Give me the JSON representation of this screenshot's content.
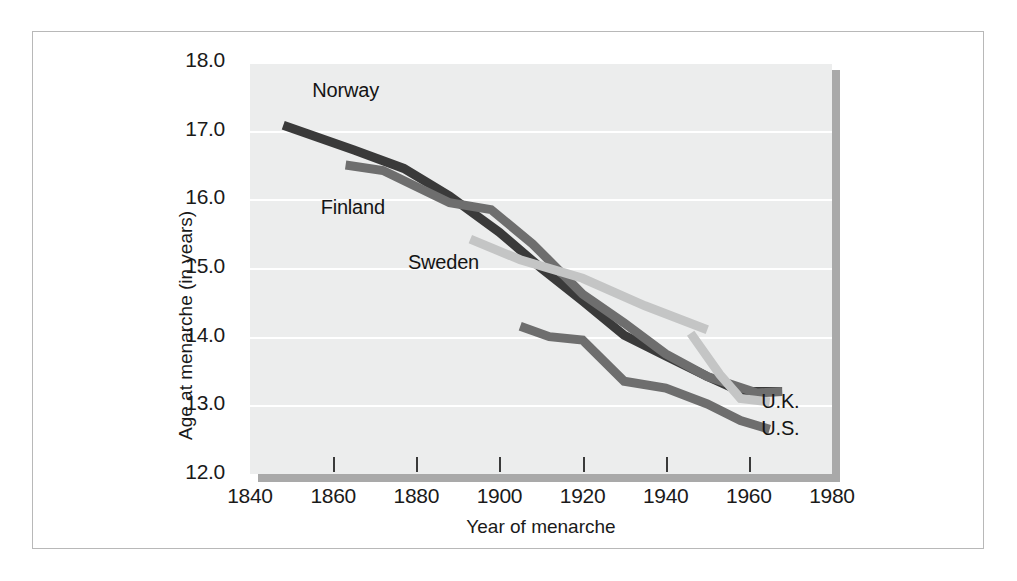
{
  "chart_data": {
    "type": "line",
    "title": "",
    "xlabel": "Year of menarche",
    "ylabel": "Age at menarche (in years)",
    "xlim": [
      1840,
      1980
    ],
    "ylim": [
      12.0,
      18.0
    ],
    "xticks": [
      1840,
      1860,
      1880,
      1900,
      1920,
      1940,
      1960,
      1980
    ],
    "xtick_labels": [
      "1840",
      "1860",
      "1880",
      "1900",
      "1920",
      "1940",
      "1960",
      "1980"
    ],
    "yticks": [
      12.0,
      13.0,
      14.0,
      15.0,
      16.0,
      17.0,
      18.0
    ],
    "ytick_labels": [
      "12.0",
      "13.0",
      "14.0",
      "15.0",
      "16.0",
      "17.0",
      "18.0"
    ],
    "grid": "horizontal",
    "legend_position": "inline-labels",
    "plot_background": "#eceded",
    "series": [
      {
        "name": "Norway",
        "color": "#3a3a3a",
        "label_x": 1855,
        "label_y": 17.55,
        "points": [
          [
            1848,
            17.08
          ],
          [
            1865,
            16.72
          ],
          [
            1877,
            16.45
          ],
          [
            1888,
            16.05
          ],
          [
            1900,
            15.52
          ],
          [
            1910,
            15.0
          ],
          [
            1920,
            14.52
          ],
          [
            1930,
            14.02
          ],
          [
            1940,
            13.72
          ],
          [
            1950,
            13.42
          ],
          [
            1958,
            13.2
          ],
          [
            1968,
            13.2
          ]
        ]
      },
      {
        "name": "Finland",
        "color": "#6e6e6e",
        "label_x": 1857,
        "label_y": 15.85,
        "points": [
          [
            1863,
            16.5
          ],
          [
            1872,
            16.42
          ],
          [
            1888,
            15.95
          ],
          [
            1898,
            15.85
          ],
          [
            1908,
            15.35
          ],
          [
            1920,
            14.62
          ],
          [
            1930,
            14.2
          ],
          [
            1940,
            13.75
          ],
          [
            1950,
            13.42
          ],
          [
            1962,
            13.18
          ],
          [
            1968,
            13.2
          ]
        ]
      },
      {
        "name": "Sweden",
        "color": "#c4c5c5",
        "label_x": 1878,
        "label_y": 15.05,
        "points": [
          [
            1893,
            15.42
          ],
          [
            1905,
            15.12
          ],
          [
            1920,
            14.85
          ],
          [
            1935,
            14.45
          ],
          [
            1950,
            14.1
          ]
        ]
      },
      {
        "name": "U.K.",
        "color": "#c4c5c5",
        "label_x": 1963,
        "label_y": 13.02,
        "points": [
          [
            1946,
            14.05
          ],
          [
            1953,
            13.45
          ],
          [
            1958,
            13.1
          ],
          [
            1965,
            13.05
          ]
        ]
      },
      {
        "name": "U.S.",
        "color": "#6e6e6e",
        "label_x": 1963,
        "label_y": 12.62,
        "points": [
          [
            1905,
            14.15
          ],
          [
            1912,
            14.0
          ],
          [
            1920,
            13.95
          ],
          [
            1930,
            13.35
          ],
          [
            1940,
            13.25
          ],
          [
            1950,
            13.02
          ],
          [
            1958,
            12.78
          ],
          [
            1965,
            12.65
          ]
        ]
      }
    ]
  }
}
